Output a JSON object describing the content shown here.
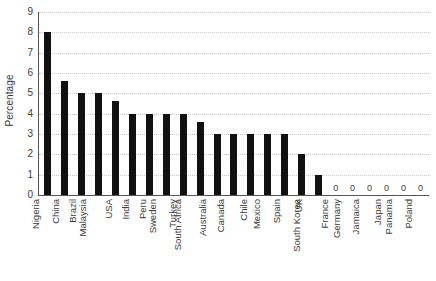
{
  "chart_data": {
    "type": "bar",
    "title": "",
    "xlabel": "",
    "ylabel": "Percentage",
    "ylim": [
      0,
      9
    ],
    "yticks": [
      0,
      1,
      2,
      3,
      4,
      5,
      6,
      7,
      8,
      9
    ],
    "ytick_labels": [
      "0",
      "1",
      "2",
      "3",
      "4",
      "5",
      "6",
      "7",
      "8",
      "9"
    ],
    "grid": true,
    "grid_axis": "y",
    "grid_style": "dotted",
    "legend": "none",
    "bar_color": "#111111",
    "axis_color": "#555555",
    "grid_color": "#c9c9c9",
    "categories": [
      "Nigeria",
      "China",
      "Brazil",
      "Malaysia",
      "USA",
      "India",
      "Peru",
      "Sweden",
      "Turkey",
      "South Africa",
      "Australia",
      "Canada",
      "Chile",
      "Mexico",
      "Spain",
      "UK",
      "South Korea",
      "France",
      "Germany",
      "Jamaica",
      "Japan",
      "Panama",
      "Poland"
    ],
    "values": [
      8.0,
      5.6,
      5.0,
      5.0,
      4.6,
      4.0,
      4.0,
      4.0,
      4.0,
      3.6,
      3.0,
      3.0,
      3.0,
      3.0,
      3.0,
      2.0,
      1.0,
      0,
      0,
      0,
      0,
      0,
      0
    ],
    "point_labels": [
      "",
      "",
      "",
      "",
      "",
      "",
      "",
      "",
      "",
      "",
      "",
      "",
      "",
      "",
      "",
      "",
      "",
      "0",
      "0",
      "0",
      "0",
      "0",
      "0"
    ]
  }
}
